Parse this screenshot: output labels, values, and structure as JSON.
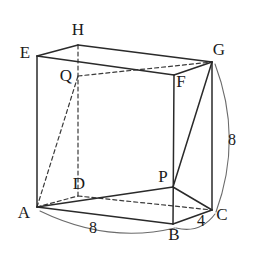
{
  "figure": {
    "shape_type": "rectangular-prism",
    "vertices": [
      {
        "name": "A",
        "label": "A",
        "x": 37,
        "y": 207,
        "label_x": 24,
        "label_y": 214
      },
      {
        "name": "B",
        "label": "B",
        "x": 173,
        "y": 224,
        "label_x": 174,
        "label_y": 236
      },
      {
        "name": "C",
        "label": "C",
        "x": 212,
        "y": 210,
        "label_x": 222,
        "label_y": 216
      },
      {
        "name": "D",
        "label": "D",
        "x": 78,
        "y": 196,
        "label_x": 79,
        "label_y": 185
      },
      {
        "name": "E",
        "label": "E",
        "x": 37,
        "y": 56,
        "label_x": 25,
        "label_y": 54
      },
      {
        "name": "F",
        "label": "F",
        "x": 174,
        "y": 75,
        "label_x": 181,
        "label_y": 83
      },
      {
        "name": "G",
        "label": "G",
        "x": 212,
        "y": 62,
        "label_x": 219,
        "label_y": 51
      },
      {
        "name": "H",
        "label": "H",
        "x": 78,
        "y": 45,
        "label_x": 78,
        "label_y": 31
      },
      {
        "name": "P",
        "label": "P",
        "x": 173,
        "y": 187,
        "label_x": 163,
        "label_y": 178
      },
      {
        "name": "Q",
        "label": "Q",
        "x": 78,
        "y": 76,
        "label_x": 66,
        "label_y": 77
      }
    ],
    "solid_edges": [
      {
        "name": "edge-E-A",
        "from": "E",
        "to": "A"
      },
      {
        "name": "edge-E-H",
        "from": "E",
        "to": "H"
      },
      {
        "name": "edge-H-G",
        "from": "H",
        "to": "G"
      },
      {
        "name": "edge-E-F",
        "from": "E",
        "to": "F"
      },
      {
        "name": "edge-F-G",
        "from": "F",
        "to": "G"
      },
      {
        "name": "edge-F-B",
        "from": "F",
        "to": "B"
      },
      {
        "name": "edge-G-C",
        "from": "G",
        "to": "C"
      },
      {
        "name": "edge-A-B",
        "from": "A",
        "to": "B"
      },
      {
        "name": "edge-B-C",
        "from": "B",
        "to": "C"
      },
      {
        "name": "edge-A-P",
        "from": "A",
        "to": "P"
      },
      {
        "name": "edge-P-C",
        "from": "P",
        "to": "C"
      },
      {
        "name": "edge-G-P",
        "from": "G",
        "to": "P"
      }
    ],
    "dashed_edges": [
      {
        "name": "edge-H-D",
        "from": "H",
        "to": "D"
      },
      {
        "name": "edge-A-D",
        "from": "A",
        "to": "D"
      },
      {
        "name": "edge-D-C",
        "from": "D",
        "to": "C"
      },
      {
        "name": "edge-Q-G",
        "from": "Q",
        "to": "G"
      },
      {
        "name": "edge-A-Q",
        "from": "A",
        "to": "Q"
      }
    ],
    "dimensions": [
      {
        "name": "dimension-AB",
        "value": "8",
        "measures": "A-B",
        "label_x": 93,
        "label_y": 229,
        "arc_path": "M 40 211 Q 108 244 175 228"
      },
      {
        "name": "dimension-BC",
        "value": "4",
        "measures": "B-C",
        "label_x": 201,
        "label_y": 222,
        "arc_path": "M 176 228 Q 200 234 215 214"
      },
      {
        "name": "dimension-GC",
        "value": "8",
        "measures": "G-C",
        "label_x": 232,
        "label_y": 141,
        "arc_path": "M 215 64 Q 243 138 216 212"
      }
    ],
    "colors": {
      "background": "#ffffff",
      "edge_solid": "#2a2a2a",
      "edge_dashed": "#3a3a3a",
      "dimension_arc": "#6b6b6b",
      "label_text": "#1a1a1a"
    }
  }
}
